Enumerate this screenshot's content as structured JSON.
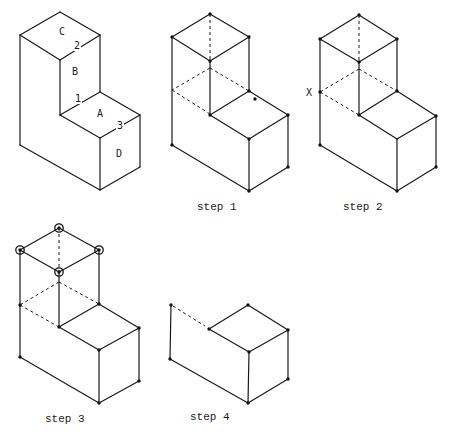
{
  "colors": {
    "ink": "#1a1a1a",
    "background": "#ffffff"
  },
  "figures": [
    {
      "id": "original",
      "caption": "",
      "edges": [
        [
          60,
          12,
          20,
          35
        ],
        [
          60,
          12,
          100,
          35
        ],
        [
          20,
          35,
          60,
          60
        ],
        [
          100,
          35,
          60,
          60
        ],
        [
          20,
          35,
          20,
          145
        ],
        [
          60,
          60,
          60,
          115
        ],
        [
          100,
          35,
          100,
          92
        ],
        [
          100,
          92,
          60,
          115
        ],
        [
          100,
          92,
          140,
          115
        ],
        [
          60,
          115,
          100,
          138
        ],
        [
          140,
          115,
          100,
          138
        ],
        [
          100,
          138,
          100,
          190
        ],
        [
          140,
          115,
          140,
          167
        ],
        [
          20,
          145,
          100,
          190
        ],
        [
          140,
          167,
          100,
          190
        ]
      ],
      "hidden_edges": [],
      "vertices": [],
      "markers": [],
      "face_labels": [
        {
          "text": "C",
          "x": 62,
          "y": 35
        },
        {
          "text": "B",
          "x": 75,
          "y": 75
        },
        {
          "text": "A",
          "x": 100,
          "y": 117
        },
        {
          "text": "D",
          "x": 119,
          "y": 157
        }
      ],
      "edge_labels": [
        {
          "text": "2",
          "x": 77,
          "y": 49
        },
        {
          "text": "1",
          "x": 78,
          "y": 102
        },
        {
          "text": "3",
          "x": 120,
          "y": 129
        }
      ]
    },
    {
      "id": "step-1",
      "caption": "step 1",
      "caption_pos": {
        "x": 197,
        "y": 210
      },
      "edges": [
        [
          210,
          14,
          172,
          37
        ],
        [
          210,
          14,
          249,
          37
        ],
        [
          172,
          37,
          210,
          61
        ],
        [
          249,
          37,
          210,
          61
        ],
        [
          172,
          37,
          172,
          145
        ],
        [
          210,
          61,
          210,
          115
        ],
        [
          249,
          37,
          249,
          91
        ],
        [
          249,
          91,
          210,
          115
        ],
        [
          249,
          91,
          288,
          115
        ],
        [
          210,
          115,
          249,
          139
        ],
        [
          288,
          115,
          249,
          139
        ],
        [
          249,
          139,
          249,
          191
        ],
        [
          288,
          115,
          288,
          167
        ],
        [
          172,
          145,
          249,
          191
        ],
        [
          288,
          167,
          249,
          191
        ]
      ],
      "hidden_edges": [
        [
          210,
          14,
          210,
          61
        ],
        [
          210,
          68,
          172,
          90
        ],
        [
          210,
          68,
          249,
          91
        ],
        [
          172,
          90,
          210,
          114
        ]
      ],
      "vertices": [
        [
          210,
          14
        ],
        [
          172,
          37
        ],
        [
          249,
          37
        ],
        [
          210,
          61
        ],
        [
          249,
          91
        ],
        [
          210,
          115
        ],
        [
          288,
          115
        ],
        [
          249,
          139
        ],
        [
          172,
          145
        ],
        [
          288,
          167
        ],
        [
          249,
          191
        ],
        [
          255,
          99
        ]
      ],
      "markers": [],
      "face_labels": [],
      "edge_labels": []
    },
    {
      "id": "step-2",
      "caption": "step 2",
      "caption_pos": {
        "x": 343,
        "y": 210
      },
      "edges": [
        [
          359,
          15,
          320,
          39
        ],
        [
          359,
          15,
          397,
          39
        ],
        [
          320,
          39,
          359,
          62
        ],
        [
          397,
          39,
          359,
          62
        ],
        [
          320,
          39,
          320,
          145
        ],
        [
          359,
          62,
          359,
          115
        ],
        [
          397,
          39,
          397,
          91
        ],
        [
          397,
          91,
          359,
          115
        ],
        [
          397,
          91,
          436,
          116
        ],
        [
          359,
          115,
          397,
          139
        ],
        [
          436,
          116,
          397,
          139
        ],
        [
          397,
          139,
          397,
          191
        ],
        [
          436,
          116,
          436,
          167
        ],
        [
          320,
          145,
          397,
          191
        ],
        [
          436,
          167,
          397,
          191
        ]
      ],
      "hidden_edges": [
        [
          359,
          15,
          359,
          62
        ],
        [
          359,
          69,
          320,
          92
        ],
        [
          359,
          69,
          397,
          91
        ],
        [
          320,
          92,
          359,
          115
        ]
      ],
      "vertices": [
        [
          359,
          15
        ],
        [
          320,
          39
        ],
        [
          397,
          39
        ],
        [
          359,
          62
        ],
        [
          320,
          92
        ],
        [
          397,
          91
        ],
        [
          359,
          115
        ],
        [
          436,
          116
        ],
        [
          320,
          145
        ],
        [
          436,
          167
        ],
        [
          397,
          191
        ]
      ],
      "markers": [],
      "face_labels": [],
      "edge_labels": [],
      "point_labels": [
        {
          "text": "X",
          "x": 309,
          "y": 96
        }
      ]
    },
    {
      "id": "step-3",
      "caption": "step 3",
      "caption_pos": {
        "x": 45,
        "y": 422
      },
      "edges": [
        [
          59,
          228,
          20,
          250
        ],
        [
          59,
          228,
          99,
          250
        ],
        [
          20,
          250,
          59,
          272
        ],
        [
          99,
          250,
          59,
          272
        ],
        [
          20,
          250,
          20,
          357
        ],
        [
          59,
          272,
          59,
          327
        ],
        [
          99,
          250,
          99,
          304
        ],
        [
          99,
          304,
          59,
          327
        ],
        [
          99,
          304,
          139,
          328
        ],
        [
          59,
          327,
          99,
          350
        ],
        [
          139,
          328,
          99,
          350
        ],
        [
          99,
          350,
          99,
          403
        ],
        [
          139,
          328,
          139,
          381
        ],
        [
          20,
          357,
          99,
          403
        ],
        [
          139,
          381,
          99,
          403
        ]
      ],
      "hidden_edges": [
        [
          59,
          228,
          59,
          272
        ],
        [
          59,
          282,
          20,
          305
        ],
        [
          59,
          282,
          99,
          304
        ],
        [
          20,
          305,
          59,
          327
        ]
      ],
      "vertices": [
        [
          59,
          228
        ],
        [
          20,
          250
        ],
        [
          99,
          250
        ],
        [
          59,
          272
        ],
        [
          20,
          305
        ],
        [
          99,
          304
        ],
        [
          59,
          327
        ],
        [
          139,
          328
        ],
        [
          99,
          350
        ],
        [
          20,
          357
        ],
        [
          139,
          381
        ],
        [
          99,
          403
        ]
      ],
      "markers": [
        [
          59,
          228
        ],
        [
          20,
          250
        ],
        [
          99,
          250
        ],
        [
          59,
          272
        ]
      ],
      "face_labels": [],
      "edge_labels": []
    },
    {
      "id": "step-4",
      "caption": "step 4",
      "caption_pos": {
        "x": 190,
        "y": 420
      },
      "edges": [
        [
          171,
          305,
          170,
          359
        ],
        [
          209,
          329,
          248,
          305
        ],
        [
          248,
          305,
          288,
          330
        ],
        [
          209,
          329,
          249,
          352
        ],
        [
          288,
          330,
          249,
          352
        ],
        [
          249,
          352,
          248,
          403
        ],
        [
          288,
          330,
          288,
          379
        ],
        [
          170,
          359,
          248,
          403
        ],
        [
          288,
          379,
          248,
          403
        ]
      ],
      "hidden_edges": [
        [
          173,
          306,
          205,
          326
        ]
      ],
      "vertices": [
        [
          171,
          305
        ],
        [
          209,
          329
        ],
        [
          248,
          305
        ],
        [
          288,
          330
        ],
        [
          249,
          352
        ],
        [
          170,
          359
        ],
        [
          288,
          379
        ],
        [
          248,
          403
        ]
      ],
      "markers": [],
      "face_labels": [],
      "edge_labels": []
    }
  ]
}
